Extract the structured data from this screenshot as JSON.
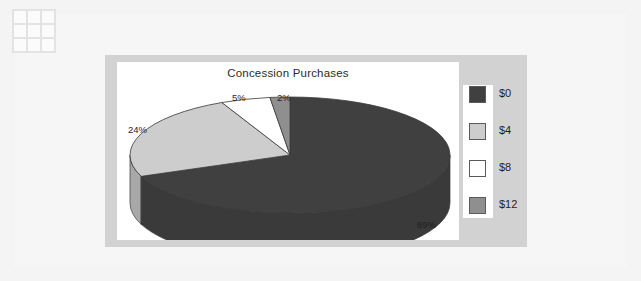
{
  "canvas": {
    "width": 641,
    "height": 281,
    "background_color": "#f4f4f4",
    "panel_color": "#d2d2d2",
    "plot_background_color": "#ffffff"
  },
  "watermark": {
    "icon": "grid-3x3-icon",
    "cells": 9
  },
  "chart_data": {
    "type": "pie",
    "title": "Concession Purchases",
    "subtitle": "",
    "xlabel": "",
    "ylabel": "",
    "is_3d": true,
    "start_angle_deg": 0,
    "direction": "clockwise",
    "legend_position": "right",
    "grid": false,
    "categories": [
      "$0",
      "$4",
      "$8",
      "$12"
    ],
    "values": [
      69,
      24,
      5,
      2
    ],
    "value_unit": "%",
    "data_labels": [
      "69%",
      "24%",
      "5%",
      "2%"
    ],
    "colors": [
      "#404040",
      "#cdcdcd",
      "#ffffff",
      "#8f8f8f"
    ],
    "side_colors": [
      "#3a3a3a",
      "#a8a8a8",
      "#d5d5d5",
      "#747474"
    ],
    "slices": [
      {
        "label": "$0",
        "percent": 69,
        "display": "69%",
        "color": "#404040"
      },
      {
        "label": "$4",
        "percent": 24,
        "display": "24%",
        "color": "#cdcdcd"
      },
      {
        "label": "$8",
        "percent": 5,
        "display": "5%",
        "color": "#ffffff"
      },
      {
        "label": "$12",
        "percent": 2,
        "display": "2%",
        "color": "#8f8f8f"
      }
    ]
  },
  "legend": {
    "items": [
      {
        "label": "$0",
        "color": "#404040"
      },
      {
        "label": "$4",
        "color": "#cdcdcd"
      },
      {
        "label": "$8",
        "color": "#ffffff"
      },
      {
        "label": "$12",
        "color": "#8f8f8f"
      }
    ]
  }
}
